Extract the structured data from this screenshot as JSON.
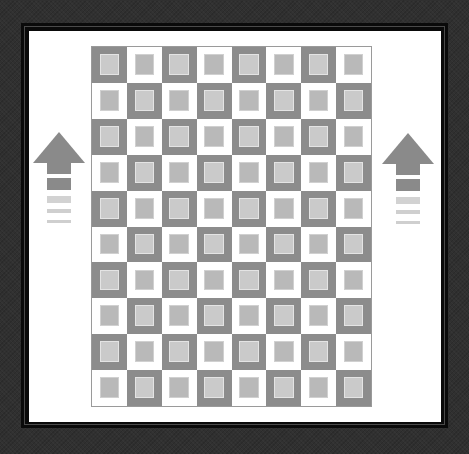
{
  "image": {
    "description": "Framed checkerboard quilt pattern with up arrows on both sides",
    "colors": {
      "background": "#303030",
      "frame": "#0a0a0a",
      "mat": "#ffffff",
      "dark_cell": "#8c8c8c",
      "dark_cell_inner": "#cacaca",
      "light_cell": "#ffffff",
      "light_cell_inner": "#b9b9b9",
      "arrow": "#8a8a8a",
      "arrow_fade": "#d2d2d2"
    }
  },
  "grid": {
    "columns": 8,
    "rows": 10,
    "first_cell": "dark"
  },
  "arrows": [
    {
      "side": "left",
      "direction": "up"
    },
    {
      "side": "right",
      "direction": "up"
    }
  ]
}
